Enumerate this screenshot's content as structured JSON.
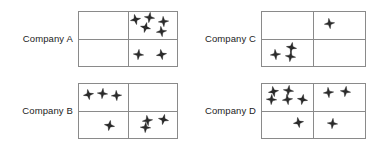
{
  "figure": {
    "type": "pictogram-grid",
    "background_color": "#ffffff",
    "border_color": "#8a8a8a",
    "star_fill_color": "#2b2b2b",
    "star_stroke_color": "#000000",
    "label_color": "#1c1c1c",
    "symbol_name": "four-pointed-star",
    "panels": [
      {
        "id": "company-a",
        "label": "Company A",
        "total_stars": 7,
        "quadrants": {
          "top_left": 0,
          "top_right": 5,
          "bottom_left": 0,
          "bottom_right": 2
        },
        "stars": [
          {
            "quadrant": "top_right",
            "x": 16,
            "y": 26,
            "rotate": -12
          },
          {
            "quadrant": "top_right",
            "x": 44,
            "y": 20,
            "rotate": 8
          },
          {
            "quadrant": "top_right",
            "x": 72,
            "y": 34,
            "rotate": -5
          },
          {
            "quadrant": "top_right",
            "x": 36,
            "y": 56,
            "rotate": 14
          },
          {
            "quadrant": "top_right",
            "x": 69,
            "y": 72,
            "rotate": -8
          },
          {
            "quadrant": "bottom_right",
            "x": 22,
            "y": 56,
            "rotate": 6
          },
          {
            "quadrant": "bottom_right",
            "x": 68,
            "y": 58,
            "rotate": -10
          }
        ]
      },
      {
        "id": "company-b",
        "label": "Company B",
        "total_stars": 7,
        "quadrants": {
          "top_left": 3,
          "top_right": 0,
          "bottom_left": 1,
          "bottom_right": 3
        },
        "stars": [
          {
            "quadrant": "top_left",
            "x": 19,
            "y": 40,
            "rotate": -10
          },
          {
            "quadrant": "top_left",
            "x": 48,
            "y": 34,
            "rotate": 6
          },
          {
            "quadrant": "top_left",
            "x": 76,
            "y": 44,
            "rotate": -4
          },
          {
            "quadrant": "bottom_left",
            "x": 62,
            "y": 52,
            "rotate": 10
          },
          {
            "quadrant": "bottom_right",
            "x": 40,
            "y": 36,
            "rotate": -8
          },
          {
            "quadrant": "bottom_right",
            "x": 72,
            "y": 32,
            "rotate": 12
          },
          {
            "quadrant": "bottom_right",
            "x": 36,
            "y": 62,
            "rotate": 4
          }
        ]
      },
      {
        "id": "company-c",
        "label": "Company C",
        "total_stars": 4,
        "quadrants": {
          "top_left": 0,
          "top_right": 1,
          "bottom_left": 3,
          "bottom_right": 0
        },
        "stars": [
          {
            "quadrant": "top_right",
            "x": 32,
            "y": 42,
            "rotate": -8
          },
          {
            "quadrant": "bottom_left",
            "x": 58,
            "y": 30,
            "rotate": 10
          },
          {
            "quadrant": "bottom_left",
            "x": 26,
            "y": 56,
            "rotate": -6
          },
          {
            "quadrant": "bottom_left",
            "x": 56,
            "y": 66,
            "rotate": 8
          }
        ]
      },
      {
        "id": "company-d",
        "label": "Company D",
        "total_stars": 9,
        "quadrants": {
          "top_left": 5,
          "top_right": 2,
          "bottom_left": 1,
          "bottom_right": 1
        },
        "stars": [
          {
            "quadrant": "top_left",
            "x": 22,
            "y": 26,
            "rotate": -10
          },
          {
            "quadrant": "top_left",
            "x": 52,
            "y": 24,
            "rotate": 8
          },
          {
            "quadrant": "top_left",
            "x": 18,
            "y": 56,
            "rotate": 4
          },
          {
            "quadrant": "top_left",
            "x": 50,
            "y": 58,
            "rotate": -8
          },
          {
            "quadrant": "top_left",
            "x": 78,
            "y": 58,
            "rotate": 10
          },
          {
            "quadrant": "top_right",
            "x": 30,
            "y": 30,
            "rotate": -6
          },
          {
            "quadrant": "top_right",
            "x": 62,
            "y": 28,
            "rotate": 8
          },
          {
            "quadrant": "bottom_left",
            "x": 70,
            "y": 42,
            "rotate": -10
          },
          {
            "quadrant": "bottom_right",
            "x": 36,
            "y": 48,
            "rotate": 6
          }
        ]
      }
    ]
  }
}
